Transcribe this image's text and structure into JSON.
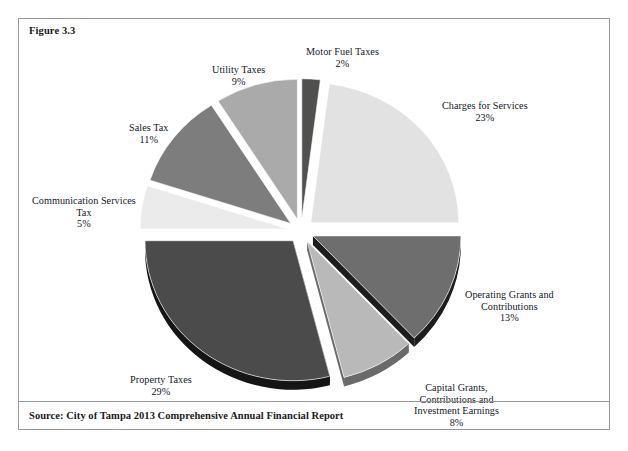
{
  "page": {
    "top_cut_text": "",
    "background_color": "#ffffff"
  },
  "figure": {
    "label": "Figure 3.3",
    "source": "Source: City of Tampa 2013 Comprehensive Annual Financial Report",
    "border_color": "#9a9a9a"
  },
  "chart_data": {
    "type": "pie",
    "title": "Figure 3.3",
    "exploded": true,
    "three_d": true,
    "total_percent": 100,
    "legend_position": "none (direct labels)",
    "categories": [
      "Motor Fuel Taxes",
      "Charges for Services",
      "Operating Grants and Contributions",
      "Capital Grants, Contributions and Investment Earnings",
      "Property Taxes",
      "Communication Services Tax",
      "Sales Tax",
      "Utility Taxes"
    ],
    "values": [
      2,
      23,
      13,
      8,
      29,
      5,
      11,
      9
    ],
    "slices": [
      {
        "name": "Motor Fuel Taxes",
        "label_lines": [
          "Motor Fuel Taxes"
        ],
        "percent_text": "2%",
        "value": 2,
        "color": "#50504f",
        "side_color": "#2c2c2c",
        "label_left": 287,
        "label_top": 27
      },
      {
        "name": "Charges for Services",
        "label_lines": [
          "Charges for Services"
        ],
        "percent_text": "23%",
        "value": 23,
        "color": "#e2e2e2",
        "side_color": "#a6a6a6",
        "label_left": 423,
        "label_top": 81
      },
      {
        "name": "Operating Grants and Contributions",
        "label_lines": [
          "Operating Grants and",
          "Contributions"
        ],
        "percent_text": "13%",
        "value": 13,
        "color": "#6e6e6e",
        "side_color": "#1d1d1d",
        "label_left": 446,
        "label_top": 270
      },
      {
        "name": "Capital Grants, Contributions and Investment Earnings",
        "label_lines": [
          "Capital Grants,",
          "Contributions and",
          "Investment Earnings"
        ],
        "percent_text": "8%",
        "value": 8,
        "color": "#b9b9b9",
        "side_color": "#6a6a6a",
        "label_left": 395,
        "label_top": 363
      },
      {
        "name": "Property Taxes",
        "label_lines": [
          "Property Taxes"
        ],
        "percent_text": "29%",
        "value": 29,
        "color": "#4b4b4b",
        "side_color": "#151515",
        "label_left": 111,
        "label_top": 355
      },
      {
        "name": "Communication Services Tax",
        "label_lines": [
          "Communication Services",
          "Tax"
        ],
        "percent_text": "5%",
        "value": 5,
        "color": "#ebebeb",
        "side_color": "#a9a9a9",
        "label_left": 13,
        "label_top": 176
      },
      {
        "name": "Sales Tax",
        "label_lines": [
          "Sales Tax"
        ],
        "percent_text": "11%",
        "value": 11,
        "color": "#7d7d7d",
        "side_color": "#242424",
        "label_left": 110,
        "label_top": 103
      },
      {
        "name": "Utility Taxes",
        "label_lines": [
          "Utility Taxes"
        ],
        "percent_text": "9%",
        "value": 9,
        "color": "#aaaaaa",
        "side_color": "#3b3b3b",
        "label_left": 193,
        "label_top": 45
      }
    ]
  }
}
